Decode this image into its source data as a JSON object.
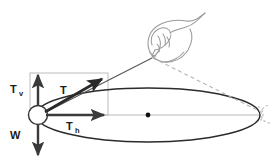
{
  "figure": {
    "background_color": "#ffffff"
  },
  "colors": {
    "ink": "#1a1a1a",
    "vector_stroke": "#3a3a3a",
    "orbit_stroke": "#2b2b2b",
    "construction_gray": "#b5b5b5",
    "dashed_gray": "#b0b0b0",
    "hand_outline": "#8a8a8a",
    "ball_fill": "#ffffff",
    "center_dot": "#111111"
  },
  "labels": {
    "tension_vertical": {
      "symbol": "T",
      "subscript": "v",
      "x": 10,
      "y": 92
    },
    "tension_resultant": {
      "symbol": "T",
      "subscript": "",
      "x": 60,
      "y": 92
    },
    "tension_horizontal": {
      "symbol": "T",
      "subscript": "h",
      "x": 66,
      "y": 128
    },
    "weight": {
      "symbol": "W",
      "subscript": "",
      "x": 10,
      "y": 137
    }
  },
  "geometry": {
    "ball": {
      "cx": 38,
      "cy": 115,
      "r": 9.5
    },
    "orbit_ellipse": {
      "cx": 148,
      "cy": 115,
      "rx": 112,
      "ry": 27
    },
    "orbit_center_dot": {
      "cx": 148,
      "cy": 115,
      "r": 2.4
    },
    "pivot_point": {
      "x": 152,
      "y": 57
    },
    "ghost_ball": {
      "cx": 262,
      "cy": 114,
      "r": 9
    },
    "vector_vertical": {
      "x1": 38,
      "y1": 108,
      "x2": 38,
      "y2": 73
    },
    "vector_weight": {
      "x1": 38,
      "y1": 122,
      "x2": 38,
      "y2": 157
    },
    "vector_horizontal": {
      "x1": 46,
      "y1": 115,
      "x2": 107,
      "y2": 115
    },
    "vector_resultant": {
      "x1": 45,
      "y1": 112,
      "x2": 105,
      "y2": 77
    },
    "construction_rect": {
      "x": 30,
      "y": 73,
      "width": 78,
      "height": 42
    }
  },
  "annotations": {
    "string_solid": "solid line from pivot to ball at left of circle",
    "string_dashed": "dashed line from pivot to ball position at right of circle",
    "orbit_note": "ellipse represents the horizontal circular path seen in perspective"
  }
}
